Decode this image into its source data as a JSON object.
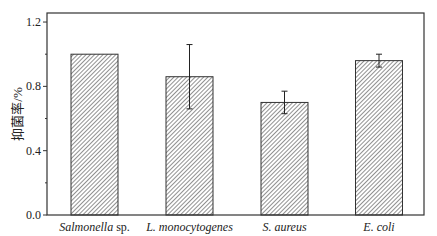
{
  "chart_data": {
    "type": "bar",
    "title": "",
    "xlabel": "",
    "ylabel": "抑菌率/%",
    "categories": [
      "Salmonella sp.",
      "L. monocytogenes",
      "S. aureus",
      "E. coli"
    ],
    "category_labels": [
      {
        "italic": "Salmonella",
        "normal": " sp."
      },
      {
        "italic": "L. monocytogenes",
        "normal": ""
      },
      {
        "italic": "S. aureus",
        "normal": ""
      },
      {
        "italic": "E. coli",
        "normal": ""
      }
    ],
    "values": [
      1.0,
      0.86,
      0.7,
      0.96
    ],
    "errors": [
      0,
      0.2,
      0.07,
      0.04
    ],
    "ylim": [
      0,
      1.26
    ],
    "yticks": [
      0.0,
      0.4,
      0.8,
      1.2
    ],
    "ytick_labels": [
      "0.0",
      "0.4",
      "0.8",
      "1.2"
    ],
    "minor_yticks": [
      0.2,
      0.6,
      1.0
    ],
    "grid": false,
    "legend": null,
    "bar_fill": "hatched diagonal",
    "colors": {
      "bar_edge": "#333333",
      "hatch": "#555555",
      "axis": "#333333"
    }
  }
}
